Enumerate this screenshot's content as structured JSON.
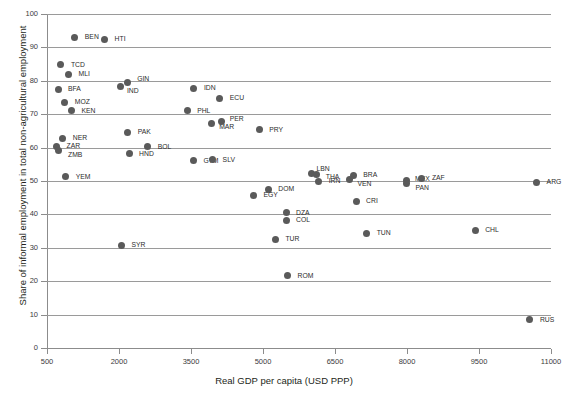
{
  "chart_data": {
    "type": "scatter",
    "title": "",
    "xlabel": "Real GDP per capita (USD PPP)",
    "ylabel": "Share of informal employment in total non-agricultural employment",
    "xlim": [
      500,
      11000
    ],
    "ylim": [
      0,
      100
    ],
    "xticks": [
      500,
      2000,
      3500,
      5000,
      6500,
      8000,
      9500,
      11000
    ],
    "yticks": [
      0,
      10,
      20,
      30,
      40,
      50,
      60,
      70,
      80,
      90,
      100
    ],
    "grid": "horizontal",
    "legend": "none",
    "marker_color": "#5a5a5a",
    "points": [
      {
        "label": "BEN",
        "x": 1080,
        "y": 93.0,
        "lx": 10,
        "ly": -4
      },
      {
        "label": "HTI",
        "x": 1700,
        "y": 92.4,
        "lx": 10,
        "ly": -4
      },
      {
        "label": "TCD",
        "x": 790,
        "y": 84.8,
        "lx": 10,
        "ly": -4
      },
      {
        "label": "MLI",
        "x": 950,
        "y": 81.9,
        "lx": 10,
        "ly": -4
      },
      {
        "label": "BFA",
        "x": 730,
        "y": 77.4,
        "lx": 10,
        "ly": -4
      },
      {
        "label": "GIN",
        "x": 2170,
        "y": 79.6,
        "lx": 10,
        "ly": -7
      },
      {
        "label": "IND",
        "x": 2040,
        "y": 78.4,
        "lx": 6,
        "ly": 1
      },
      {
        "label": "IDN",
        "x": 3560,
        "y": 77.7,
        "lx": 10,
        "ly": -4
      },
      {
        "label": "MOZ",
        "x": 870,
        "y": 73.6,
        "lx": 10,
        "ly": -4
      },
      {
        "label": "ECU",
        "x": 4100,
        "y": 74.8,
        "lx": 10,
        "ly": -4
      },
      {
        "label": "KEN",
        "x": 1010,
        "y": 71.0,
        "lx": 10,
        "ly": -4
      },
      {
        "label": "PHL",
        "x": 3420,
        "y": 71.0,
        "lx": 10,
        "ly": -4
      },
      {
        "label": "MAR",
        "x": 3920,
        "y": 67.2,
        "lx": 8,
        "ly": -1
      },
      {
        "label": "PER",
        "x": 4140,
        "y": 67.9,
        "lx": 8,
        "ly": -6
      },
      {
        "label": "PRY",
        "x": 4920,
        "y": 65.3,
        "lx": 10,
        "ly": -4
      },
      {
        "label": "PAK",
        "x": 2180,
        "y": 64.6,
        "lx": 10,
        "ly": -4
      },
      {
        "label": "NER",
        "x": 830,
        "y": 62.8,
        "lx": 10,
        "ly": -4
      },
      {
        "label": "ZAR",
        "x": 700,
        "y": 60.2,
        "lx": 10,
        "ly": -5
      },
      {
        "label": "ZMB",
        "x": 730,
        "y": 59.0,
        "lx": 10,
        "ly": 0
      },
      {
        "label": "BOL",
        "x": 2600,
        "y": 60.2,
        "lx": 10,
        "ly": -4
      },
      {
        "label": "HND",
        "x": 2210,
        "y": 58.1,
        "lx": 10,
        "ly": -4
      },
      {
        "label": "GTM",
        "x": 3550,
        "y": 56.0,
        "lx": 10,
        "ly": -4
      },
      {
        "label": "SLV",
        "x": 3950,
        "y": 56.3,
        "lx": 10,
        "ly": -4
      },
      {
        "label": "YEM",
        "x": 890,
        "y": 51.2,
        "lx": 10,
        "ly": -4
      },
      {
        "label": "LBN",
        "x": 6010,
        "y": 52.2,
        "lx": 5,
        "ly": -9
      },
      {
        "label": "THA",
        "x": 6120,
        "y": 51.8,
        "lx": 9,
        "ly": -2
      },
      {
        "label": "IRN",
        "x": 6160,
        "y": 49.9,
        "lx": 10,
        "ly": -4
      },
      {
        "label": "BRA",
        "x": 6880,
        "y": 51.6,
        "lx": 10,
        "ly": -5
      },
      {
        "label": "VEN",
        "x": 6800,
        "y": 50.3,
        "lx": 8,
        "ly": 0
      },
      {
        "label": "MEX",
        "x": 7980,
        "y": 50.2,
        "lx": 9,
        "ly": -5
      },
      {
        "label": "PAN",
        "x": 7990,
        "y": 49.4,
        "lx": 9,
        "ly": 1
      },
      {
        "label": "ZAF",
        "x": 8310,
        "y": 50.8,
        "lx": 10,
        "ly": -4
      },
      {
        "label": "ARG",
        "x": 10700,
        "y": 49.7,
        "lx": 10,
        "ly": -4
      },
      {
        "label": "DOM",
        "x": 5110,
        "y": 47.6,
        "lx": 10,
        "ly": -4
      },
      {
        "label": "EGY",
        "x": 4800,
        "y": 45.8,
        "lx": 10,
        "ly": -4
      },
      {
        "label": "CRI",
        "x": 6940,
        "y": 44.0,
        "lx": 10,
        "ly": -4
      },
      {
        "label": "DZA",
        "x": 5480,
        "y": 40.5,
        "lx": 10,
        "ly": -4
      },
      {
        "label": "COL",
        "x": 5480,
        "y": 38.2,
        "lx": 10,
        "ly": -4
      },
      {
        "label": "TUN",
        "x": 7160,
        "y": 34.4,
        "lx": 10,
        "ly": -4
      },
      {
        "label": "CHL",
        "x": 9420,
        "y": 35.2,
        "lx": 10,
        "ly": -4
      },
      {
        "label": "TUR",
        "x": 5260,
        "y": 32.6,
        "lx": 10,
        "ly": -4
      },
      {
        "label": "SYR",
        "x": 2050,
        "y": 30.8,
        "lx": 10,
        "ly": -4
      },
      {
        "label": "ROM",
        "x": 5510,
        "y": 21.7,
        "lx": 10,
        "ly": -4
      },
      {
        "label": "RUS",
        "x": 10560,
        "y": 8.5,
        "lx": 10,
        "ly": -4
      }
    ]
  }
}
